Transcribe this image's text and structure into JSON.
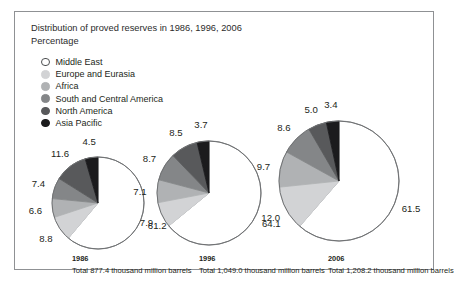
{
  "chart_data": {
    "type": "pie",
    "title": "Distribution of proved reserves in 1986, 1996, 2006\nPercentage",
    "ylabel": "",
    "xlabel": "",
    "legend_position": "top-left",
    "grid": false,
    "categories": [
      "Middle East",
      "Europe and Eurasia",
      "Africa",
      "South and Central America",
      "North America",
      "Asia Pacific"
    ],
    "colors": [
      "#ffffff",
      "#d2d3d5",
      "#b0b2b4",
      "#848688",
      "#58595b",
      "#1b1b1d"
    ],
    "series": [
      {
        "name": "1986",
        "total_label": "Total 877.4 thousand million barrels",
        "values": [
          61.2,
          8.8,
          6.6,
          7.4,
          11.6,
          4.5
        ]
      },
      {
        "name": "1996",
        "total_label": "Total 1,049.0 thousand million barrels",
        "values": [
          64.1,
          7.9,
          7.1,
          8.7,
          8.5,
          3.7
        ]
      },
      {
        "name": "2006",
        "total_label": "Total 1,208.2 thousand million barrels",
        "values": [
          61.5,
          12.0,
          9.7,
          8.6,
          5.0,
          3.4
        ]
      }
    ]
  },
  "legend": {
    "items": [
      {
        "label": "Middle East",
        "color": "#ffffff"
      },
      {
        "label": "Europe and Eurasia",
        "color": "#d2d3d5"
      },
      {
        "label": "Africa",
        "color": "#b0b2b4"
      },
      {
        "label": "South and Central America",
        "color": "#848688"
      },
      {
        "label": "North America",
        "color": "#58595b"
      },
      {
        "label": "Asia Pacific",
        "color": "#1b1b1d"
      }
    ]
  },
  "pies": [
    {
      "year": "1986",
      "total_label": "Total 877.4 thousand million barrels",
      "labels": [
        "61.2",
        "8.8",
        "6.6",
        "7.4",
        "11.6",
        "4.5"
      ]
    },
    {
      "year": "1996",
      "total_label": "Total 1,049.0 thousand million barrels",
      "labels": [
        "64.1",
        "7.9",
        "7.1",
        "8.7",
        "8.5",
        "3.7"
      ]
    },
    {
      "year": "2006",
      "total_label": "Total 1,208.2 thousand million barrels",
      "labels": [
        "61.5",
        "12.0",
        "9.7",
        "8.6",
        "5.0",
        "3.4"
      ]
    }
  ]
}
